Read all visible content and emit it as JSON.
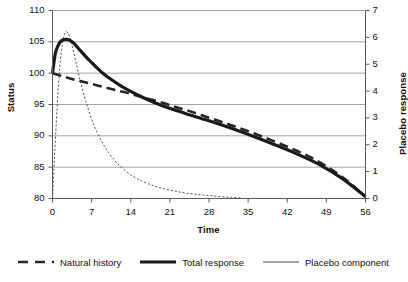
{
  "chart_data": {
    "type": "line",
    "title": "",
    "xlabel": "Time",
    "ylabel": "Status",
    "y2label": "Placebo response",
    "xlim": [
      0,
      56
    ],
    "ylim": [
      80,
      110
    ],
    "y2lim": [
      0,
      7
    ],
    "grid": true,
    "x_ticks": [
      "0",
      "7",
      "14",
      "21",
      "28",
      "35",
      "42",
      "49",
      "56"
    ],
    "y_ticks": [
      "80",
      "85",
      "90",
      "95",
      "100",
      "105",
      "110"
    ],
    "y2_ticks": [
      "0",
      "1",
      "2",
      "3",
      "4",
      "5",
      "6",
      "7"
    ],
    "legend_position": "bottom",
    "series": [
      {
        "name": "Natural history",
        "axis": "left",
        "style": "dashed",
        "width": 2.6,
        "color": "#262626",
        "x": [
          0,
          2,
          4,
          6,
          8,
          10,
          12,
          14,
          16,
          18,
          20,
          22,
          24,
          28,
          32,
          36,
          40,
          44,
          48,
          52,
          56
        ],
        "y": [
          100.0,
          99.45,
          98.95,
          98.5,
          98.05,
          97.6,
          97.15,
          96.7,
          96.2,
          95.7,
          95.2,
          94.6,
          94.1,
          92.9,
          91.7,
          90.4,
          89.0,
          87.5,
          85.7,
          83.3,
          80.3
        ]
      },
      {
        "name": "Total response",
        "axis": "left",
        "style": "solid",
        "width": 3.2,
        "color": "#1a1a1a",
        "x": [
          0,
          0.5,
          1,
          1.5,
          2,
          2.5,
          3,
          3.5,
          4,
          5,
          6,
          7,
          8,
          9,
          10,
          12,
          14,
          16,
          18,
          20,
          22,
          24,
          28,
          32,
          36,
          40,
          44,
          48,
          52,
          56
        ],
        "y": [
          100.0,
          103.1,
          104.4,
          105.1,
          105.35,
          105.4,
          105.3,
          105.0,
          104.6,
          103.6,
          102.6,
          101.7,
          100.8,
          100.0,
          99.3,
          98.1,
          97.1,
          96.2,
          95.4,
          94.7,
          94.1,
          93.5,
          92.4,
          91.2,
          89.9,
          88.5,
          87.0,
          85.3,
          83.1,
          80.3
        ]
      },
      {
        "name": "Placebo component",
        "axis": "right",
        "style": "dotted",
        "width": 1.0,
        "color": "#4d4d4d",
        "x": [
          0,
          0.3,
          0.8,
          1.3,
          1.8,
          2.2,
          2.6,
          3,
          3.5,
          4,
          4.5,
          5,
          6,
          7,
          8,
          9,
          10,
          11,
          12,
          14,
          16,
          18,
          20,
          22,
          24,
          26,
          28,
          30,
          32,
          34
        ],
        "y": [
          0.0,
          1.3,
          3.3,
          4.9,
          5.8,
          6.15,
          6.2,
          6.05,
          5.7,
          5.25,
          4.8,
          4.35,
          3.6,
          2.95,
          2.45,
          2.05,
          1.72,
          1.45,
          1.22,
          0.88,
          0.65,
          0.48,
          0.36,
          0.27,
          0.2,
          0.15,
          0.11,
          0.07,
          0.04,
          0.02
        ]
      }
    ]
  },
  "legend": {
    "items": [
      {
        "label": "Natural history"
      },
      {
        "label": "Total response"
      },
      {
        "label": "Placebo component"
      }
    ]
  }
}
